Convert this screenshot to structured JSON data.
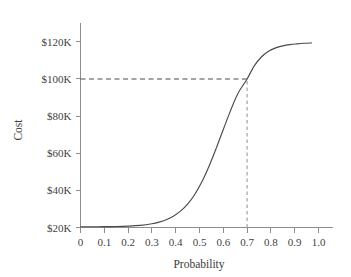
{
  "chart_data": {
    "type": "line",
    "title": "",
    "subtitle": "",
    "xlabel": "Probability",
    "ylabel": "Cost",
    "xlim": [
      0,
      1.04
    ],
    "ylim": [
      20000,
      125000
    ],
    "grid": false,
    "legend": null,
    "x_tick_labels": [
      "0",
      "0.1",
      "0.2",
      "0.3",
      "0.4",
      "0.5",
      "0.6",
      "0.7",
      "0.8",
      "0.9",
      "1.0"
    ],
    "x_tick_values": [
      0,
      0.1,
      0.2,
      0.3,
      0.4,
      0.5,
      0.6,
      0.7,
      0.8,
      0.9,
      1.0
    ],
    "y_tick_labels": [
      "$20K",
      "$40K",
      "$60K",
      "$80K",
      "$100K",
      "$120K"
    ],
    "y_tick_values": [
      20000,
      40000,
      60000,
      80000,
      100000,
      120000
    ],
    "series": [
      {
        "name": "Cost curve",
        "color": "#4a4a4a",
        "x": [
          0.0,
          0.05,
          0.1,
          0.15,
          0.2,
          0.25,
          0.3,
          0.33,
          0.36,
          0.39,
          0.42,
          0.45,
          0.48,
          0.51,
          0.54,
          0.57,
          0.6,
          0.63,
          0.66,
          0.7,
          0.73,
          0.76,
          0.79,
          0.82,
          0.85,
          0.88,
          0.91,
          0.94,
          0.97
        ],
        "y": [
          20400,
          20400,
          20450,
          20550,
          20750,
          21150,
          22000,
          22900,
          24200,
          26100,
          28800,
          32600,
          37800,
          44600,
          53000,
          62600,
          72800,
          82800,
          91800,
          100000,
          107000,
          111800,
          114900,
          116700,
          117800,
          118500,
          118900,
          119200,
          119400
        ]
      }
    ],
    "annotations": [
      {
        "name": "guide-horizontal",
        "type": "dashed-line",
        "orientation": "horizontal",
        "value": 100000,
        "from_x": 0,
        "to_x": 0.7,
        "color": "#4a4a4a"
      },
      {
        "name": "guide-vertical",
        "type": "dashed-line",
        "orientation": "vertical",
        "value": 0.7,
        "from_y": 20000,
        "to_y": 100000,
        "color": "#9a9a9a"
      }
    ],
    "highlight_point": {
      "probability": 0.7,
      "cost": 100000,
      "cost_label": "$100K",
      "probability_label": "0.7"
    }
  }
}
